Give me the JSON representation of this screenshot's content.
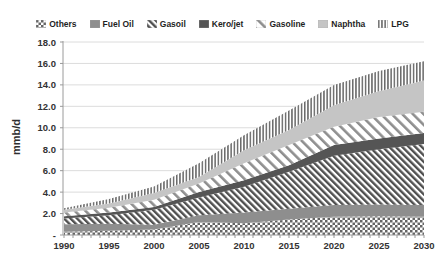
{
  "page": {
    "background": "#ffffff"
  },
  "chart_data": {
    "type": "area",
    "stacked": true,
    "title": "",
    "ylabel": "mmb/d",
    "xlabel": "",
    "grid": true,
    "legend_position": "top",
    "xlim": [
      1990,
      2030
    ],
    "ylim": [
      0,
      18
    ],
    "y_tick_step": 2,
    "y_tick_labels": [
      "-",
      "2.0",
      "4.0",
      "6.0",
      "8.0",
      "10.0",
      "12.0",
      "14.0",
      "16.0",
      "18.0"
    ],
    "x": [
      1990,
      1995,
      2000,
      2005,
      2010,
      2015,
      2020,
      2025,
      2030
    ],
    "x_tick_labels": [
      "1990",
      "1995",
      "2000",
      "2005",
      "2010",
      "2015",
      "2020",
      "2025",
      "2030"
    ],
    "x_minor_tick_every_years": 1,
    "axis_color": "#9a9a9a",
    "grid_color": "#dcdcdc",
    "series": [
      {
        "name": "Others",
        "fill_pattern": "checker",
        "color": "#656565",
        "values": [
          0.3,
          0.4,
          0.5,
          1.2,
          1.1,
          1.45,
          1.7,
          1.75,
          1.7
        ]
      },
      {
        "name": "Fuel Oil",
        "fill_pattern": "solid",
        "color": "#8e8e8e",
        "values": [
          0.7,
          0.65,
          0.45,
          0.65,
          1.0,
          1.0,
          1.1,
          1.1,
          1.1
        ]
      },
      {
        "name": "Gasoil",
        "fill_pattern": "diagonal-dense",
        "color": "#4f4f4f",
        "values": [
          0.55,
          0.8,
          1.4,
          1.65,
          2.4,
          3.45,
          4.6,
          5.15,
          5.7
        ]
      },
      {
        "name": "Kero/jet",
        "fill_pattern": "solid",
        "color": "#555555",
        "values": [
          0.2,
          0.25,
          0.27,
          0.5,
          0.6,
          0.6,
          1.0,
          1.0,
          1.0
        ]
      },
      {
        "name": "Gasoline",
        "fill_pattern": "diagonal-sparse",
        "color": "#8f8f8f",
        "values": [
          0.35,
          0.45,
          0.66,
          0.8,
          1.6,
          1.9,
          1.7,
          2.0,
          2.0
        ]
      },
      {
        "name": "Naphtha",
        "fill_pattern": "solid",
        "color": "#c5c5c5",
        "values": [
          0.25,
          0.4,
          0.64,
          0.6,
          1.2,
          1.4,
          2.0,
          2.4,
          2.9
        ]
      },
      {
        "name": "LPG",
        "fill_pattern": "vertical-stripes",
        "color": "#6a6a6a",
        "values": [
          0.15,
          0.4,
          0.6,
          1.3,
          1.4,
          1.8,
          1.9,
          1.9,
          1.8
        ]
      }
    ]
  }
}
